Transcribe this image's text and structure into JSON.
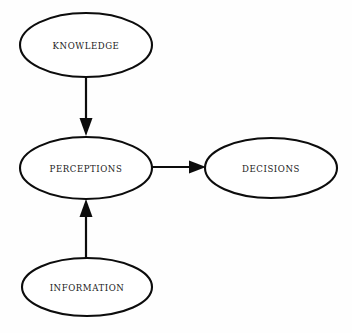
{
  "diagram": {
    "background_color": "#fefefe",
    "stroke_color": "#0c0c0c",
    "label_color": "#1a1a1a",
    "nodes": [
      {
        "id": "knowledge",
        "label": "KNOWLEDGE",
        "shape": "ellipse",
        "cx": 86,
        "cy": 45,
        "rx": 66,
        "ry": 32
      },
      {
        "id": "perceptions",
        "label": "PERCEPTIONS",
        "shape": "ellipse",
        "cx": 86,
        "cy": 168,
        "rx": 66,
        "ry": 31
      },
      {
        "id": "decisions",
        "label": "DECISIONS",
        "shape": "ellipse",
        "cx": 271,
        "cy": 168,
        "rx": 66,
        "ry": 30
      },
      {
        "id": "information",
        "label": "INFORMATION",
        "shape": "ellipse",
        "cx": 87,
        "cy": 287,
        "rx": 65,
        "ry": 29
      }
    ],
    "edges": [
      {
        "id": "knowledge-to-perceptions",
        "from": "knowledge",
        "to": "perceptions",
        "direction": "down",
        "x1": 86,
        "y1": 77,
        "x2": 86,
        "y2": 136
      },
      {
        "id": "information-to-perceptions",
        "from": "information",
        "to": "perceptions",
        "direction": "up",
        "x1": 86,
        "y1": 258,
        "x2": 86,
        "y2": 199
      },
      {
        "id": "perceptions-to-decisions",
        "from": "perceptions",
        "to": "decisions",
        "direction": "right",
        "x1": 152,
        "y1": 167,
        "x2": 206,
        "y2": 167
      }
    ]
  }
}
